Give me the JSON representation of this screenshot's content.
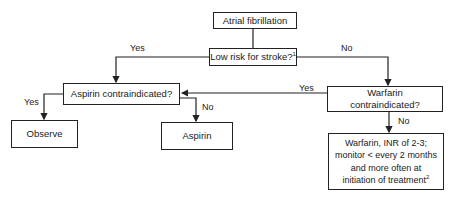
{
  "diagram": {
    "type": "flowchart",
    "nodes": {
      "start": {
        "text": "Atrial fibrillation"
      },
      "low_risk": {
        "text": "Low risk for stroke?",
        "footnote": "1"
      },
      "aspirin_contra": {
        "text": "Aspirin contraindicated?"
      },
      "warfarin_contra": {
        "line1": "Warfarin",
        "line2": "contraindicated?"
      },
      "observe": {
        "text": "Observe"
      },
      "aspirin": {
        "text": "Aspirin"
      },
      "warfarin_rx": {
        "line1": "Warfarin, INR of 2-3;",
        "line2": "monitor < every 2 months",
        "line3": "and more often at",
        "line4": "initiation of treatment",
        "footnote": "2"
      }
    },
    "edge_labels": {
      "low_risk_yes": "Yes",
      "low_risk_no": "No",
      "warfarin_contra_yes": "Yes",
      "warfarin_contra_no": "No",
      "aspirin_contra_yes": "Yes",
      "aspirin_contra_no": "No"
    },
    "colors": {
      "line": "#222222",
      "background": "#ffffff"
    }
  }
}
